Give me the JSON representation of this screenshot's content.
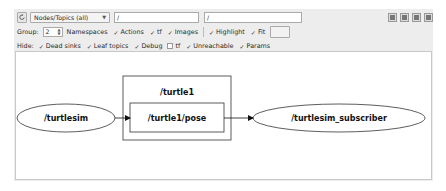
{
  "toolbar": {
    "refresh_icon": "refresh-icon",
    "mode_select": "Nodes/Topics (all)",
    "namespace_filter": "/",
    "topic_filter": "/",
    "right_buttons": [
      "load-dot-icon",
      "save-dot-icon",
      "save-svg-icon",
      "save-image-icon"
    ]
  },
  "group_row": {
    "group_label": "Group:",
    "group_value": "2",
    "options": [
      {
        "label": "Namespaces",
        "checked": null
      },
      {
        "label": "Actions",
        "checked": true
      },
      {
        "label": "tf",
        "checked": true
      },
      {
        "label": "Images",
        "checked": true
      }
    ],
    "highlight": {
      "label": "Highlight",
      "checked": true
    },
    "fit": {
      "label": "Fit",
      "checked": true
    }
  },
  "hide_row": {
    "hide_label": "Hide:",
    "options": [
      {
        "label": "Dead sinks",
        "checked": true
      },
      {
        "label": "Leaf topics",
        "checked": true
      },
      {
        "label": "Debug",
        "checked": true
      },
      {
        "label": "tf",
        "checked": false
      },
      {
        "label": "Unreachable",
        "checked": true
      },
      {
        "label": "Params",
        "checked": true
      }
    ]
  },
  "graph": {
    "nodes": [
      {
        "id": "turtlesim",
        "label": "/turtlesim",
        "shape": "ellipse"
      },
      {
        "id": "subscriber",
        "label": "/turtlesim_subscriber",
        "shape": "ellipse"
      }
    ],
    "namespace_box": {
      "label": "/turtle1"
    },
    "topics": [
      {
        "id": "pose",
        "label": "/turtle1/pose",
        "shape": "box"
      }
    ],
    "edges": [
      {
        "from": "turtlesim",
        "to": "pose"
      },
      {
        "from": "pose",
        "to": "subscriber"
      }
    ]
  }
}
